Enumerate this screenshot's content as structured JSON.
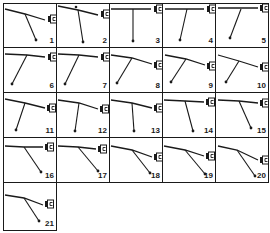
{
  "figure": {
    "colors": {
      "ink": "#1a1a1a",
      "background": "#ffffff"
    },
    "grid": {
      "columns": 5,
      "col_edges": [
        3,
        56,
        109,
        162,
        215,
        268
      ],
      "row_edges": [
        3,
        47,
        92,
        137,
        182,
        230
      ]
    },
    "panels": [
      {
        "label": "1",
        "row": 0,
        "col": 0,
        "cable": [
          [
            5,
            9
          ],
          [
            25,
            14
          ],
          [
            45,
            20
          ]
        ],
        "hub": [
          25,
          14
        ],
        "bob": [
          36,
          40
        ],
        "plug": [
          49,
          16
        ],
        "plug_style": "open"
      },
      {
        "label": "2",
        "row": 0,
        "col": 1,
        "cable": [
          [
            58,
            6
          ],
          [
            78,
            10
          ],
          [
            98,
            15
          ]
        ],
        "hub": [
          78,
          10
        ],
        "bob": [
          83,
          42
        ],
        "plug": [
          102,
          11
        ],
        "plug_style": "half",
        "marker": [
          76,
          7
        ]
      },
      {
        "label": "3",
        "row": 0,
        "col": 2,
        "cable": [
          [
            111,
            9
          ],
          [
            133,
            9
          ],
          [
            151,
            9
          ]
        ],
        "hub": [
          133,
          9
        ],
        "bob": [
          133,
          41
        ],
        "plug": [
          155,
          6
        ],
        "plug_style": "half"
      },
      {
        "label": "4",
        "row": 0,
        "col": 3,
        "cable": [
          [
            165,
            9
          ],
          [
            187,
            9
          ],
          [
            204,
            9
          ]
        ],
        "hub": [
          187,
          9
        ],
        "bob": [
          180,
          40
        ],
        "plug": [
          208,
          6
        ],
        "plug_style": "half"
      },
      {
        "label": "5",
        "row": 0,
        "col": 4,
        "cable": [
          [
            218,
            8
          ],
          [
            241,
            8
          ],
          [
            258,
            8
          ]
        ],
        "hub": [
          241,
          9
        ],
        "bob": [
          230,
          38
        ],
        "plug": [
          261,
          5
        ],
        "plug_style": "dark"
      },
      {
        "label": "6",
        "row": 1,
        "col": 0,
        "cable": [
          [
            5,
            54
          ],
          [
            27,
            55
          ],
          [
            45,
            57
          ]
        ],
        "hub": [
          27,
          55
        ],
        "bob": [
          12,
          84
        ],
        "plug": [
          49,
          54
        ],
        "plug_style": "half"
      },
      {
        "label": "7",
        "row": 1,
        "col": 1,
        "cable": [
          [
            58,
            54
          ],
          [
            79,
            55
          ],
          [
            98,
            57
          ]
        ],
        "hub": [
          79,
          55
        ],
        "bob": [
          65,
          84
        ],
        "plug": [
          102,
          54
        ],
        "plug_style": "half"
      },
      {
        "label": "8",
        "row": 1,
        "col": 2,
        "cable": [
          [
            111,
            55
          ],
          [
            132,
            58
          ],
          [
            152,
            64
          ]
        ],
        "hub": [
          132,
          58
        ],
        "bob": [
          117,
          83
        ],
        "plug": [
          155,
          62
        ],
        "plug_style": "open"
      },
      {
        "label": "9",
        "row": 1,
        "col": 3,
        "cable": [
          [
            165,
            55
          ],
          [
            186,
            59
          ],
          [
            205,
            65
          ]
        ],
        "hub": [
          186,
          59
        ],
        "bob": [
          171,
          82
        ],
        "plug": [
          208,
          63
        ],
        "plug_style": "half"
      },
      {
        "label": "10",
        "row": 1,
        "col": 4,
        "cable": [
          [
            218,
            55
          ],
          [
            239,
            61
          ],
          [
            258,
            67
          ]
        ],
        "hub": [
          239,
          61
        ],
        "bob": [
          226,
          82
        ],
        "plug": [
          261,
          64
        ],
        "plug_style": "half"
      },
      {
        "label": "11",
        "row": 2,
        "col": 0,
        "cable": [
          [
            5,
            99
          ],
          [
            25,
            103
          ],
          [
            45,
            108
          ]
        ],
        "hub": [
          25,
          103
        ],
        "bob": [
          16,
          130
        ],
        "plug": [
          48,
          105
        ],
        "plug_style": "half"
      },
      {
        "label": "12",
        "row": 2,
        "col": 1,
        "cable": [
          [
            58,
            100
          ],
          [
            79,
            103
          ],
          [
            98,
            109
          ]
        ],
        "hub": [
          79,
          103
        ],
        "bob": [
          75,
          131
        ],
        "plug": [
          101,
          106
        ],
        "plug_style": "half"
      },
      {
        "label": "13",
        "row": 2,
        "col": 2,
        "cable": [
          [
            111,
            100
          ],
          [
            132,
            103
          ],
          [
            152,
            108
          ]
        ],
        "hub": [
          132,
          103
        ],
        "bob": [
          134,
          131
        ],
        "plug": [
          155,
          105
        ],
        "plug_style": "open"
      },
      {
        "label": "14",
        "row": 2,
        "col": 3,
        "cable": [
          [
            164,
            100
          ],
          [
            185,
            101
          ],
          [
            204,
            102
          ]
        ],
        "hub": [
          185,
          101
        ],
        "bob": [
          193,
          131
        ],
        "plug": [
          207,
          99
        ],
        "plug_style": "half"
      },
      {
        "label": "15",
        "row": 2,
        "col": 4,
        "cable": [
          [
            218,
            100
          ],
          [
            239,
            101
          ],
          [
            258,
            103
          ]
        ],
        "hub": [
          239,
          101
        ],
        "bob": [
          251,
          128
        ],
        "plug": [
          261,
          100
        ],
        "plug_style": "dark"
      },
      {
        "label": "16",
        "row": 3,
        "col": 0,
        "cable": [
          [
            5,
            146
          ],
          [
            24,
            147
          ],
          [
            43,
            147
          ]
        ],
        "hub": [
          24,
          147
        ],
        "bob": [
          41,
          172
        ],
        "plug": [
          46,
          144
        ],
        "plug_style": "half"
      },
      {
        "label": "17",
        "row": 3,
        "col": 1,
        "cable": [
          [
            58,
            146
          ],
          [
            78,
            147
          ],
          [
            96,
            149
          ]
        ],
        "hub": [
          78,
          147
        ],
        "bob": [
          98,
          171
        ],
        "plug": [
          99,
          146
        ],
        "plug_style": "half"
      },
      {
        "label": "18",
        "row": 3,
        "col": 2,
        "cable": [
          [
            111,
            146
          ],
          [
            132,
            150
          ],
          [
            152,
            157
          ]
        ],
        "hub": [
          132,
          150
        ],
        "bob": [
          150,
          173
        ],
        "plug": [
          155,
          154
        ],
        "plug_style": "open"
      },
      {
        "label": "19",
        "row": 3,
        "col": 3,
        "cable": [
          [
            164,
            146
          ],
          [
            185,
            150
          ],
          [
            204,
            156
          ]
        ],
        "hub": [
          185,
          150
        ],
        "bob": [
          205,
          174
        ],
        "plug": [
          207,
          153
        ],
        "plug_style": "half"
      },
      {
        "label": "20",
        "row": 3,
        "col": 4,
        "cable": [
          [
            218,
            146
          ],
          [
            237,
            150
          ],
          [
            258,
            160
          ]
        ],
        "hub": [
          237,
          150
        ],
        "bob": [
          255,
          176
        ],
        "plug": [
          261,
          157
        ],
        "plug_style": "dark"
      },
      {
        "label": "21",
        "row": 4,
        "col": 0,
        "cable": [
          [
            5,
            195
          ],
          [
            24,
            198
          ],
          [
            43,
            205
          ]
        ],
        "hub": [
          24,
          198
        ],
        "bob": [
          39,
          221
        ],
        "plug": [
          46,
          201
        ],
        "plug_style": "half"
      }
    ]
  }
}
